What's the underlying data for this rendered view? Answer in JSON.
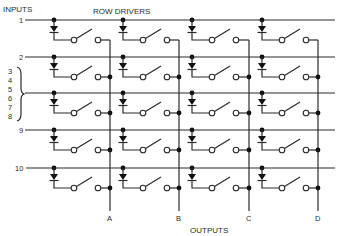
{
  "diagram": {
    "title_inputs": "INPUTS",
    "title_row_drivers": "ROW DRIVERS",
    "title_outputs": "OUTPUTS",
    "colors": {
      "ink": "#2a2a2a",
      "background": "#ffffff"
    },
    "inputs": [
      {
        "label": "1",
        "y": 20
      },
      {
        "label": "2",
        "y": 57
      },
      {
        "label": "3\n4\n5\n6\n7\n8",
        "y": 93,
        "grouped": [
          "3",
          "4",
          "5",
          "6",
          "7",
          "8"
        ]
      },
      {
        "label": "9",
        "y": 130
      },
      {
        "label": "10",
        "y": 168
      }
    ],
    "group_labels": [
      "3",
      "4",
      "5",
      "6",
      "7",
      "8"
    ],
    "row_labels": [
      "1",
      "2",
      "9",
      "10"
    ],
    "driver_columns_x": [
      54,
      123,
      192,
      262
    ],
    "outputs": [
      {
        "label": "A",
        "x": 110
      },
      {
        "label": "B",
        "x": 179
      },
      {
        "label": "C",
        "x": 249
      },
      {
        "label": "D",
        "x": 318
      }
    ],
    "cell": {
      "components": [
        "junction-dot",
        "diode",
        "switch",
        "output-junction-dot"
      ]
    }
  }
}
